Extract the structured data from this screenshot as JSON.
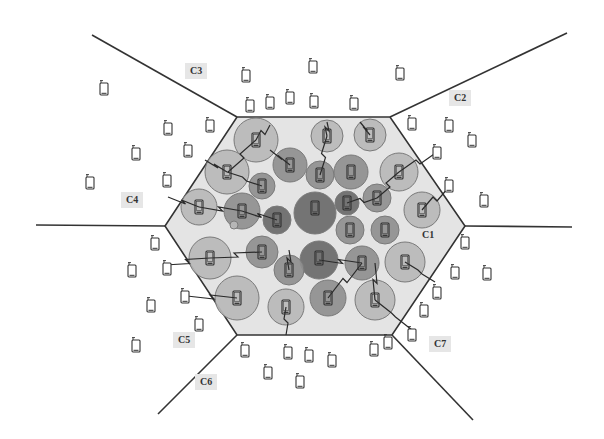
{
  "diagram": {
    "title": "",
    "colors": {
      "background": "#ffffff",
      "cell_fill": "#e4e4e4",
      "border": "#333333",
      "circle_light": "#b8b8b8",
      "circle_mid": "#8f8f8f",
      "circle_dark": "#6a6a6a",
      "phone": "#333333"
    },
    "center_cell": {
      "label": "C1",
      "hexagon": [
        [
          237,
          117
        ],
        [
          390,
          117
        ],
        [
          465,
          226
        ],
        [
          392,
          335
        ],
        [
          237,
          335
        ],
        [
          165,
          226
        ]
      ]
    },
    "cell_labels": [
      {
        "id": "C1",
        "label": "C1",
        "x": 428,
        "y": 235
      },
      {
        "id": "C2",
        "label": "C2",
        "x": 460,
        "y": 98
      },
      {
        "id": "C3",
        "label": "C3",
        "x": 196,
        "y": 71
      },
      {
        "id": "C4",
        "label": "C4",
        "x": 132,
        "y": 200
      },
      {
        "id": "C5",
        "label": "C5",
        "x": 184,
        "y": 340
      },
      {
        "id": "C6",
        "label": "C6",
        "x": 206,
        "y": 382
      },
      {
        "id": "C7",
        "label": "C7",
        "x": 440,
        "y": 344
      }
    ],
    "boundary_lines": [
      {
        "from": [
          237,
          117
        ],
        "to": [
          92,
          35
        ]
      },
      {
        "from": [
          390,
          117
        ],
        "to": [
          567,
          33
        ]
      },
      {
        "from": [
          465,
          226
        ],
        "to": [
          572,
          227
        ]
      },
      {
        "from": [
          392,
          335
        ],
        "to": [
          473,
          420
        ]
      },
      {
        "from": [
          237,
          335
        ],
        "to": [
          158,
          414
        ]
      },
      {
        "from": [
          165,
          226
        ],
        "to": [
          36,
          225
        ]
      }
    ],
    "clusters": [
      {
        "x": 256,
        "y": 140,
        "r": 22,
        "shade": "light"
      },
      {
        "x": 327,
        "y": 136,
        "r": 16,
        "shade": "light"
      },
      {
        "x": 370,
        "y": 135,
        "r": 16,
        "shade": "light"
      },
      {
        "x": 227,
        "y": 172,
        "r": 22,
        "shade": "light"
      },
      {
        "x": 290,
        "y": 165,
        "r": 17,
        "shade": "mid"
      },
      {
        "x": 320,
        "y": 175,
        "r": 14,
        "shade": "mid"
      },
      {
        "x": 351,
        "y": 172,
        "r": 17,
        "shade": "mid"
      },
      {
        "x": 399,
        "y": 172,
        "r": 19,
        "shade": "light"
      },
      {
        "x": 262,
        "y": 186,
        "r": 13,
        "shade": "mid"
      },
      {
        "x": 199,
        "y": 207,
        "r": 18,
        "shade": "light"
      },
      {
        "x": 242,
        "y": 211,
        "r": 18,
        "shade": "mid"
      },
      {
        "x": 277,
        "y": 220,
        "r": 14,
        "shade": "dark"
      },
      {
        "x": 315,
        "y": 213,
        "r": 21,
        "shade": "dark"
      },
      {
        "x": 347,
        "y": 203,
        "r": 12,
        "shade": "dark"
      },
      {
        "x": 377,
        "y": 198,
        "r": 14,
        "shade": "mid"
      },
      {
        "x": 350,
        "y": 230,
        "r": 14,
        "shade": "mid"
      },
      {
        "x": 385,
        "y": 230,
        "r": 14,
        "shade": "mid"
      },
      {
        "x": 422,
        "y": 210,
        "r": 18,
        "shade": "light"
      },
      {
        "x": 210,
        "y": 258,
        "r": 21,
        "shade": "light"
      },
      {
        "x": 262,
        "y": 252,
        "r": 16,
        "shade": "mid"
      },
      {
        "x": 319,
        "y": 260,
        "r": 19,
        "shade": "dark"
      },
      {
        "x": 289,
        "y": 270,
        "r": 15,
        "shade": "mid"
      },
      {
        "x": 362,
        "y": 263,
        "r": 17,
        "shade": "mid"
      },
      {
        "x": 405,
        "y": 262,
        "r": 20,
        "shade": "light"
      },
      {
        "x": 237,
        "y": 298,
        "r": 22,
        "shade": "light"
      },
      {
        "x": 286,
        "y": 307,
        "r": 18,
        "shade": "light"
      },
      {
        "x": 328,
        "y": 298,
        "r": 18,
        "shade": "mid"
      },
      {
        "x": 375,
        "y": 300,
        "r": 20,
        "shade": "light"
      },
      {
        "x": 234,
        "y": 225,
        "r": 4,
        "shade": "light"
      }
    ],
    "links": [
      [
        [
          256,
          140
        ],
        [
          270,
          125
        ]
      ],
      [
        [
          256,
          140
        ],
        [
          228,
          172
        ]
      ],
      [
        [
          327,
          136
        ],
        [
          327,
          122
        ]
      ],
      [
        [
          327,
          136
        ],
        [
          320,
          175
        ]
      ],
      [
        [
          370,
          135
        ],
        [
          360,
          122
        ]
      ],
      [
        [
          227,
          172
        ],
        [
          205,
          160
        ]
      ],
      [
        [
          227,
          172
        ],
        [
          262,
          186
        ]
      ],
      [
        [
          290,
          165
        ],
        [
          270,
          150
        ]
      ],
      [
        [
          399,
          172
        ],
        [
          437,
          152
        ]
      ],
      [
        [
          399,
          172
        ],
        [
          377,
          198
        ]
      ],
      [
        [
          199,
          207
        ],
        [
          168,
          197
        ]
      ],
      [
        [
          242,
          211
        ],
        [
          199,
          207
        ]
      ],
      [
        [
          277,
          220
        ],
        [
          242,
          211
        ]
      ],
      [
        [
          347,
          203
        ],
        [
          377,
          198
        ]
      ],
      [
        [
          422,
          210
        ],
        [
          448,
          188
        ]
      ],
      [
        [
          210,
          258
        ],
        [
          165,
          265
        ]
      ],
      [
        [
          262,
          252
        ],
        [
          210,
          258
        ]
      ],
      [
        [
          289,
          270
        ],
        [
          289,
          250
        ]
      ],
      [
        [
          362,
          263
        ],
        [
          319,
          260
        ]
      ],
      [
        [
          405,
          262
        ],
        [
          435,
          282
        ]
      ],
      [
        [
          237,
          298
        ],
        [
          187,
          296
        ]
      ],
      [
        [
          286,
          307
        ],
        [
          286,
          335
        ]
      ],
      [
        [
          328,
          298
        ],
        [
          362,
          263
        ]
      ],
      [
        [
          375,
          300
        ],
        [
          375,
          263
        ]
      ],
      [
        [
          375,
          300
        ],
        [
          412,
          330
        ]
      ]
    ],
    "inner_phones": [
      [
        256,
        140
      ],
      [
        327,
        136
      ],
      [
        370,
        135
      ],
      [
        227,
        172
      ],
      [
        290,
        165
      ],
      [
        320,
        175
      ],
      [
        351,
        172
      ],
      [
        399,
        172
      ],
      [
        262,
        186
      ],
      [
        199,
        207
      ],
      [
        242,
        211
      ],
      [
        277,
        220
      ],
      [
        315,
        208
      ],
      [
        347,
        203
      ],
      [
        377,
        198
      ],
      [
        350,
        230
      ],
      [
        385,
        230
      ],
      [
        422,
        210
      ],
      [
        210,
        258
      ],
      [
        262,
        252
      ],
      [
        319,
        258
      ],
      [
        289,
        270
      ],
      [
        362,
        263
      ],
      [
        405,
        262
      ],
      [
        237,
        298
      ],
      [
        286,
        307
      ],
      [
        328,
        298
      ],
      [
        375,
        300
      ]
    ],
    "outer_phones": [
      [
        104,
        88
      ],
      [
        246,
        75
      ],
      [
        313,
        66
      ],
      [
        400,
        73
      ],
      [
        250,
        105
      ],
      [
        270,
        102
      ],
      [
        290,
        97
      ],
      [
        314,
        101
      ],
      [
        354,
        103
      ],
      [
        168,
        128
      ],
      [
        210,
        125
      ],
      [
        412,
        123
      ],
      [
        449,
        125
      ],
      [
        472,
        140
      ],
      [
        136,
        153
      ],
      [
        188,
        150
      ],
      [
        437,
        152
      ],
      [
        90,
        182
      ],
      [
        167,
        180
      ],
      [
        449,
        185
      ],
      [
        484,
        200
      ],
      [
        155,
        243
      ],
      [
        465,
        242
      ],
      [
        132,
        270
      ],
      [
        167,
        268
      ],
      [
        455,
        272
      ],
      [
        487,
        273
      ],
      [
        437,
        292
      ],
      [
        185,
        296
      ],
      [
        151,
        305
      ],
      [
        199,
        324
      ],
      [
        424,
        310
      ],
      [
        412,
        334
      ],
      [
        136,
        345
      ],
      [
        245,
        350
      ],
      [
        288,
        352
      ],
      [
        309,
        355
      ],
      [
        332,
        360
      ],
      [
        374,
        349
      ],
      [
        388,
        342
      ],
      [
        268,
        372
      ],
      [
        300,
        381
      ]
    ]
  }
}
